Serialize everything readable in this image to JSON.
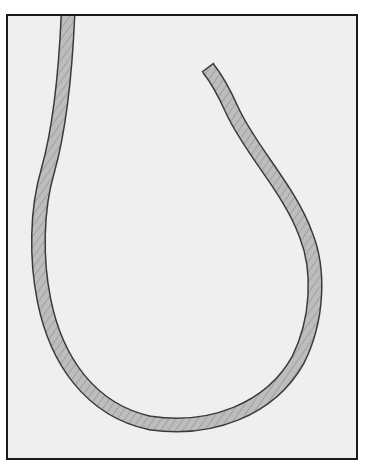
{
  "diagram": {
    "colors": {
      "background": "#efefef",
      "frame_border": "#1a1a1a",
      "rope_fill": "#b8b8b8",
      "rope_outline": "#3a3a3a",
      "rope_strand": "#9a9a9a"
    },
    "rope": {
      "path": "M 68 15 C 66 60, 62 120, 48 170 C 36 210, 36 260, 44 300 C 56 360, 90 410, 150 423 C 210 432, 270 410, 298 360 C 318 320, 320 270, 306 235 C 290 190, 250 150, 232 110 C 224 92, 216 78, 208 68",
      "width": 13
    }
  }
}
